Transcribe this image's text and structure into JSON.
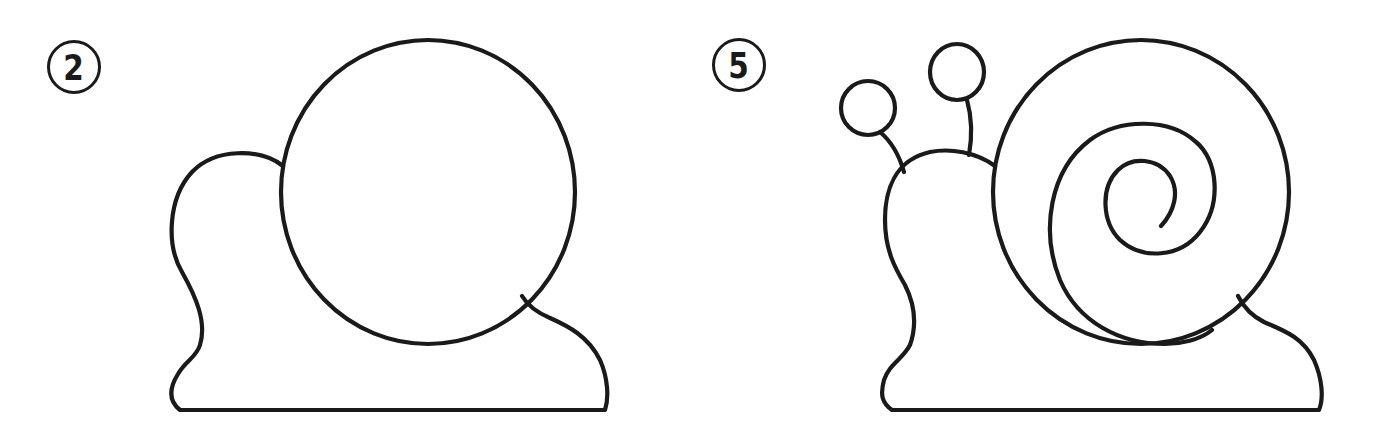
{
  "colors": {
    "stroke": "#1a1a1a",
    "background": "#ffffff"
  },
  "steps": [
    {
      "number": "2",
      "description": "Snail body with large circular shell",
      "parts": [
        "body",
        "shell-circle",
        "foot"
      ]
    },
    {
      "number": "5",
      "description": "Snail with antennae, eye stalks and spiral shell",
      "parts": [
        "body",
        "shell-circle",
        "shell-spiral",
        "left-antenna",
        "right-antenna",
        "left-eye",
        "right-eye",
        "foot"
      ]
    }
  ]
}
